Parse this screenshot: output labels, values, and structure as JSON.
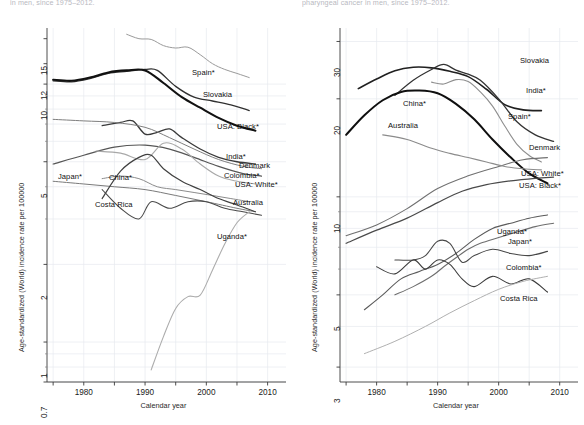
{
  "figure": {
    "panels": [
      {
        "id": "left",
        "title": "in men, since 1975–2012.",
        "axes": {
          "xlabel": "Calendar year",
          "ylabel": "Age-standardized (World) incidence rate per 100000",
          "xticks": [
            "1980",
            "1990",
            "2000",
            "2010"
          ],
          "yticks": [
            "15",
            "12",
            "10",
            "5",
            "2",
            "1",
            "0.7"
          ],
          "xlim": [
            1974,
            2013
          ],
          "ylim": [
            0.7,
            16.5
          ],
          "yscale": "log",
          "grid": true
        },
        "labels": [
          "Spain*",
          "Slovakia",
          "USA: Black*",
          "India*",
          "Denmark",
          "Colombia*",
          "USA: White*",
          "Australia",
          "Japan*",
          "China*",
          "Costa Rica",
          "Uganda*"
        ]
      },
      {
        "id": "right",
        "title": "pharyngeal cancer in men, since 1975–2012.",
        "axes": {
          "xlabel": "Calendar year",
          "ylabel": "Age-standardized (World) incidence rate per 100000",
          "xticks": [
            "1980",
            "1990",
            "2000",
            "2010"
          ],
          "yticks": [
            "30",
            "20",
            "10",
            "5",
            "3"
          ],
          "xlim": [
            1974,
            2013
          ],
          "ylim": [
            2.7,
            33
          ],
          "yscale": "log",
          "grid": true
        },
        "labels": [
          "Slovakia",
          "India*",
          "Spain*",
          "Denmark",
          "USA: White*",
          "USA: Black*",
          "Uganda*",
          "Japan*",
          "Colombia*",
          "Costa Rica",
          "China*",
          "Australia"
        ]
      }
    ]
  },
  "chart_data": [
    {
      "type": "line",
      "panel": "left",
      "title": "in men, since 1975–2012.",
      "xlabel": "Calendar year",
      "ylabel": "Age-standardized (World) incidence rate per 100000",
      "yscale": "log",
      "xlim": [
        1974,
        2013
      ],
      "ylim": [
        0.7,
        16.5
      ],
      "xticks": [
        1980,
        1990,
        2000,
        2010
      ],
      "yticks": [
        0.7,
        1,
        2,
        5,
        10,
        12,
        15
      ],
      "grid": true,
      "legend_position": "inline-right",
      "series": [
        {
          "name": "Spain*",
          "color": "#9a9a9a",
          "width": 1.0,
          "x": [
            1987,
            1989,
            1991,
            1993,
            1995,
            1997,
            1999,
            2001,
            2003,
            2005,
            2007
          ],
          "y": [
            15.6,
            15.0,
            14.9,
            14.1,
            13.8,
            13.9,
            13.0,
            12.0,
            11.4,
            11.0,
            10.6
          ]
        },
        {
          "name": "Slovakia",
          "color": "#303030",
          "width": 1.3,
          "x": [
            1975,
            1978,
            1981,
            1984,
            1987,
            1990,
            1992,
            1995,
            1998,
            2001,
            2004,
            2007
          ],
          "y": [
            10.3,
            10.2,
            10.5,
            11.0,
            11.2,
            11.4,
            11.3,
            9.8,
            8.9,
            8.6,
            8.3,
            7.9
          ]
        },
        {
          "name": "USA: Black*",
          "color": "#111111",
          "width": 2.1,
          "x": [
            1975,
            1978,
            1981,
            1984,
            1987,
            1990,
            1993,
            1996,
            1999,
            2002,
            2005,
            2008
          ],
          "y": [
            10.4,
            10.3,
            10.6,
            11.1,
            11.3,
            11.3,
            10.1,
            8.9,
            8.1,
            7.4,
            6.9,
            6.6
          ]
        },
        {
          "name": "India*",
          "color": "#3a3a3a",
          "width": 1.3,
          "x": [
            1983,
            1986,
            1988,
            1990,
            1992,
            1994,
            1996,
            1999,
            2002,
            2005,
            2008
          ],
          "y": [
            6.9,
            7.1,
            7.2,
            6.4,
            6.5,
            6.7,
            6.2,
            5.6,
            5.2,
            5.0,
            4.9
          ]
        },
        {
          "name": "Denmark",
          "color": "#7e7e7e",
          "width": 1.0,
          "x": [
            1975,
            1980,
            1985,
            1990,
            1994,
            1998,
            2002,
            2006,
            2009
          ],
          "y": [
            7.3,
            7.2,
            7.1,
            6.8,
            6.2,
            5.6,
            5.1,
            4.8,
            4.7
          ]
        },
        {
          "name": "Colombia*",
          "color": "#565656",
          "width": 1.2,
          "x": [
            1975,
            1980,
            1985,
            1990,
            1994,
            1998,
            2002,
            2006,
            2009
          ],
          "y": [
            4.9,
            5.3,
            5.7,
            5.8,
            5.6,
            5.2,
            4.8,
            4.5,
            4.4
          ]
        },
        {
          "name": "USA: White*",
          "color": "#a8a8a8",
          "width": 1.1,
          "x": [
            1982,
            1986,
            1990,
            1993,
            1996,
            1999,
            2002,
            2005,
            2008
          ],
          "y": [
            5.5,
            5.4,
            5.1,
            5.9,
            5.6,
            4.9,
            4.4,
            4.2,
            4.1
          ]
        },
        {
          "name": "Australia",
          "color": "#8c8c8c",
          "width": 1.0,
          "x": [
            1983,
            1986,
            1989,
            1992,
            1995,
            1998,
            2001,
            2004,
            2007
          ],
          "y": [
            4.3,
            4.4,
            4.3,
            4.0,
            3.9,
            3.8,
            3.7,
            3.6,
            3.5
          ]
        },
        {
          "name": "Japan*",
          "color": "#7a7a7a",
          "width": 1.0,
          "x": [
            1975,
            1980,
            1985,
            1990,
            1995,
            2000,
            2005,
            2008
          ],
          "y": [
            4.2,
            4.1,
            4.0,
            3.9,
            3.7,
            3.5,
            3.3,
            3.2
          ]
        },
        {
          "name": "China*",
          "color": "#404040",
          "width": 1.2,
          "x": [
            1983,
            1986,
            1989,
            1991,
            1993,
            1996,
            1999,
            2002,
            2005,
            2008
          ],
          "y": [
            3.6,
            4.6,
            5.2,
            5.3,
            4.7,
            4.2,
            3.9,
            3.6,
            3.4,
            3.2
          ]
        },
        {
          "name": "Costa Rica",
          "color": "#4a4a4a",
          "width": 1.1,
          "x": [
            1983,
            1986,
            1989,
            1991,
            1994,
            1997,
            2000,
            2003,
            2006,
            2009
          ],
          "y": [
            3.9,
            3.3,
            3.0,
            3.5,
            3.3,
            3.5,
            3.5,
            3.3,
            3.2,
            3.1
          ]
        },
        {
          "name": "Uganda*",
          "color": "#adadad",
          "width": 1.1,
          "x": [
            1991,
            1993,
            1995,
            1997,
            1999,
            2001,
            2003,
            2005,
            2007
          ],
          "y": [
            0.78,
            1.05,
            1.35,
            1.5,
            1.52,
            1.9,
            2.4,
            2.9,
            3.2
          ]
        }
      ]
    },
    {
      "type": "line",
      "panel": "right",
      "title": "pharyngeal cancer in men, since 1975–2012.",
      "xlabel": "Calendar year",
      "ylabel": "Age-standardized (World) incidence rate per 100000",
      "yscale": "log",
      "xlim": [
        1974,
        2013
      ],
      "ylim": [
        2.7,
        33
      ],
      "xticks": [
        1980,
        1990,
        2000,
        2010
      ],
      "yticks": [
        3,
        5,
        10,
        20,
        30
      ],
      "grid": true,
      "legend_position": "inline-right",
      "series": [
        {
          "name": "Slovakia",
          "color": "#202020",
          "width": 1.6,
          "x": [
            1977,
            1980,
            1983,
            1986,
            1989,
            1992,
            1995,
            1998,
            2001,
            2004,
            2007
          ],
          "y": [
            21.5,
            23.0,
            24.4,
            25.0,
            24.9,
            24.3,
            23.4,
            21.4,
            19.2,
            18.5,
            18.4
          ]
        },
        {
          "name": "India*",
          "color": "#333333",
          "width": 1.3,
          "x": [
            1983,
            1986,
            1989,
            1991,
            1993,
            1995,
            1997,
            2000,
            2003,
            2006,
            2009
          ],
          "y": [
            20.5,
            22.8,
            24.6,
            25.5,
            24.5,
            23.8,
            22.8,
            20.0,
            17.0,
            15.5,
            14.8
          ]
        },
        {
          "name": "Spain*",
          "color": "#8e8e8e",
          "width": 1.1,
          "x": [
            1989,
            1991,
            1993,
            1995,
            1997,
            1999,
            2001,
            2003,
            2005,
            2007
          ],
          "y": [
            22.5,
            22.2,
            22.9,
            22.6,
            21.0,
            19.0,
            16.5,
            14.5,
            13.4,
            12.8
          ]
        },
        {
          "name": "China*",
          "color": "#0f0f0f",
          "width": 2.0,
          "x": [
            1975,
            1978,
            1981,
            1984,
            1987,
            1990,
            1993,
            1996,
            1999,
            2002,
            2005,
            2008
          ],
          "y": [
            15.5,
            17.8,
            19.8,
            21.0,
            21.2,
            20.8,
            19.3,
            17.3,
            15.0,
            13.2,
            11.8,
            11.0
          ]
        },
        {
          "name": "Denmark",
          "color": "#707070",
          "width": 1.1,
          "x": [
            1975,
            1980,
            1985,
            1990,
            1995,
            2000,
            2004,
            2008
          ],
          "y": [
            7.6,
            8.2,
            9.2,
            10.6,
            11.6,
            12.4,
            13.0,
            13.2
          ]
        },
        {
          "name": "USA: White*",
          "color": "#8b8b8b",
          "width": 1.1,
          "x": [
            1981,
            1985,
            1989,
            1992,
            1995,
            1998,
            2001,
            2004,
            2007
          ],
          "y": [
            15.5,
            15.0,
            14.1,
            13.6,
            13.2,
            12.8,
            12.4,
            12.2,
            12.1
          ]
        },
        {
          "name": "USA: Black*",
          "color": "#4a4a4a",
          "width": 1.2,
          "x": [
            1975,
            1980,
            1985,
            1990,
            1994,
            1998,
            2002,
            2006,
            2009
          ],
          "y": [
            7.2,
            7.9,
            8.6,
            9.6,
            10.4,
            10.9,
            11.2,
            11.4,
            11.5
          ]
        },
        {
          "name": "Uganda*",
          "color": "#5a5a5a",
          "width": 1.1,
          "x": [
            1978,
            1981,
            1984,
            1987,
            1990,
            1993,
            1996,
            1999,
            2002,
            2005,
            2008
          ],
          "y": [
            4.5,
            5.0,
            5.6,
            5.9,
            6.2,
            6.7,
            7.4,
            8.0,
            8.3,
            8.6,
            8.8
          ]
        },
        {
          "name": "Japan*",
          "color": "#6e6e6e",
          "width": 1.1,
          "x": [
            1983,
            1986,
            1989,
            1991,
            1993,
            1995,
            1997,
            2000,
            2003,
            2006,
            2009
          ],
          "y": [
            5.0,
            5.3,
            5.7,
            6.1,
            6.5,
            6.9,
            7.2,
            7.5,
            7.8,
            8.1,
            8.3
          ]
        },
        {
          "name": "Colombia*",
          "color": "#474747",
          "width": 1.1,
          "x": [
            1983,
            1986,
            1988,
            1990,
            1992,
            1994,
            1996,
            1999,
            2002,
            2005,
            2008
          ],
          "y": [
            6.4,
            6.4,
            6.6,
            7.3,
            7.2,
            6.3,
            6.6,
            6.9,
            6.7,
            6.6,
            6.8
          ]
        },
        {
          "name": "Costa Rica",
          "color": "#3b3b3b",
          "width": 1.1,
          "x": [
            1980,
            1983,
            1986,
            1988,
            1990,
            1992,
            1994,
            1996,
            1999,
            2002,
            2005,
            2008
          ],
          "y": [
            6.1,
            5.8,
            6.4,
            6.0,
            6.4,
            6.2,
            5.6,
            5.3,
            5.7,
            5.4,
            5.6,
            5.1
          ]
        },
        {
          "name": "Australia",
          "color": "#b0b0b0",
          "width": 1.0,
          "x": [
            1978,
            1983,
            1988,
            1992,
            1996,
            2000,
            2004,
            2008
          ],
          "y": [
            3.3,
            3.6,
            4.0,
            4.4,
            4.8,
            5.2,
            5.5,
            5.7
          ]
        }
      ]
    }
  ]
}
